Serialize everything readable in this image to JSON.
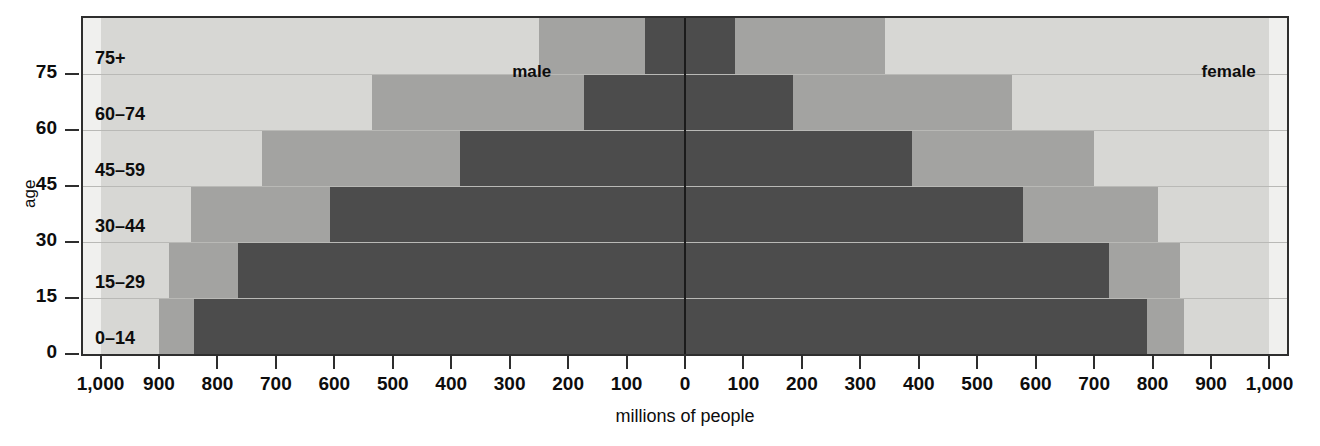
{
  "chart_data": {
    "type": "bar",
    "subtype": "population-pyramid",
    "title": "",
    "xlabel": "millions of people",
    "ylabel": "age",
    "legend": {
      "left": "male",
      "right": "female",
      "position": "inside-top"
    },
    "categories": [
      "0–14",
      "15–29",
      "30–44",
      "45–59",
      "60–74",
      "75+"
    ],
    "y_tick_labels": [
      "0",
      "15",
      "30",
      "45",
      "60",
      "75"
    ],
    "y_tick_values": [
      0,
      15,
      30,
      45,
      60,
      75
    ],
    "x_tick_labels": [
      "1,000",
      "900",
      "800",
      "700",
      "600",
      "500",
      "400",
      "300",
      "200",
      "100",
      "0",
      "100",
      "200",
      "300",
      "400",
      "500",
      "600",
      "700",
      "800",
      "900",
      "1,000"
    ],
    "x_tick_values": [
      -1000,
      -900,
      -800,
      -700,
      -600,
      -500,
      -400,
      -300,
      -200,
      -100,
      0,
      100,
      200,
      300,
      400,
      500,
      600,
      700,
      800,
      900,
      1000
    ],
    "xlim": [
      -1030,
      1030
    ],
    "grid": false,
    "tone_names": [
      "dark",
      "mid",
      "light"
    ],
    "tone_colors": {
      "dark": "#4c4c4c",
      "mid": "#a3a3a1",
      "light": "#d7d7d4",
      "background": "#f0f0ee"
    },
    "series": [
      {
        "name": "male",
        "side": "left",
        "dark": [
          840,
          765,
          607,
          385,
          173,
          69
        ],
        "mid": [
          900,
          883,
          845,
          723,
          535,
          250
        ],
        "light": [
          1000,
          1000,
          1000,
          1000,
          1000,
          1000
        ]
      },
      {
        "name": "female",
        "side": "right",
        "dark": [
          790,
          725,
          578,
          388,
          185,
          85
        ],
        "mid": [
          853,
          847,
          810,
          700,
          560,
          342
        ],
        "light": [
          1000,
          1000,
          1000,
          1000,
          1000,
          1000
        ]
      }
    ]
  },
  "axes": {
    "y_title": "age",
    "x_title": "millions of people"
  }
}
